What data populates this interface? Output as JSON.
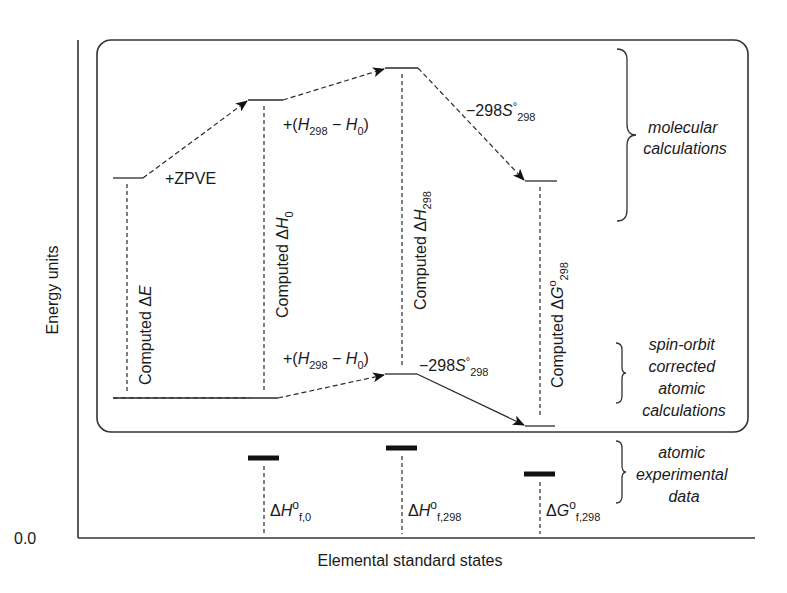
{
  "diagram": {
    "y_axis_label": "Energy units",
    "y_axis_zero": "0.0",
    "x_axis_label": "Elemental standard states",
    "molecular_levels": [
      {
        "id": "dE",
        "label_prefix": "Computed Δ",
        "label_var": "E",
        "label_sub": ""
      },
      {
        "id": "dH0",
        "label_prefix": "Computed Δ",
        "label_var": "H",
        "label_sub": "0"
      },
      {
        "id": "dH298",
        "label_prefix": "Computed Δ",
        "label_var": "H",
        "label_sub": "298"
      },
      {
        "id": "dG298",
        "label_prefix": "Computed Δ",
        "label_var": "G",
        "label_sup": "o",
        "label_sub": "298"
      }
    ],
    "steps": {
      "zpve": "+ZPVE",
      "thermal_prefix": "+(",
      "thermal_h": "H",
      "thermal_sub1": "298",
      "thermal_minus": " − ",
      "thermal_sub2": "0",
      "thermal_close": ")",
      "entropy_prefix": "−298",
      "entropy_s": "S",
      "entropy_sup": "°",
      "entropy_sub": "298"
    },
    "experimental": [
      {
        "id": "dHf0",
        "delta": "Δ",
        "var": "H",
        "sup": "o",
        "sub": "f,0"
      },
      {
        "id": "dHf298",
        "delta": "Δ",
        "var": "H",
        "sup": "o",
        "sub": "f,298"
      },
      {
        "id": "dGf298",
        "delta": "Δ",
        "var": "G",
        "sup": "o",
        "sub": "f,298"
      }
    ],
    "groups": {
      "molecular": [
        "molecular",
        "calculations"
      ],
      "spin_orbit": [
        "spin-orbit",
        "corrected",
        "atomic",
        "calculations"
      ],
      "experimental": [
        "atomic",
        "experimental",
        "data"
      ]
    }
  }
}
